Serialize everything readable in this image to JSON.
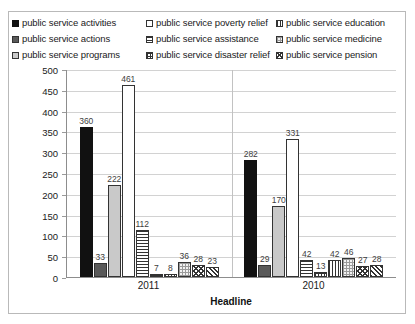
{
  "chart_data": {
    "type": "bar",
    "title": "",
    "xlabel": "Headline",
    "ylabel": "",
    "ylim": [
      0,
      500
    ],
    "ytick_step": 50,
    "yticks": [
      "500",
      "450",
      "400",
      "350",
      "300",
      "250",
      "200",
      "150",
      "100",
      "50",
      "0"
    ],
    "grid": true,
    "legend_position": "top",
    "categories": [
      "2011",
      "2010"
    ],
    "series": [
      {
        "name": "public service activities",
        "pattern": "solid-black",
        "values": [
          360,
          282
        ]
      },
      {
        "name": "public service actions",
        "pattern": "solid-dark",
        "values": [
          33,
          29
        ]
      },
      {
        "name": "public service programs",
        "pattern": "solid-light",
        "values": [
          222,
          170
        ]
      },
      {
        "name": "public service poverty relief",
        "pattern": "white",
        "values": [
          461,
          331
        ]
      },
      {
        "name": "public service assistance",
        "pattern": "hlines",
        "values": [
          112,
          42
        ]
      },
      {
        "name": "public service disaster relief",
        "pattern": "grid",
        "values": [
          7,
          13
        ]
      },
      {
        "name": "public service education",
        "pattern": "vlines",
        "values": [
          8,
          42
        ]
      },
      {
        "name": "public service medicine",
        "pattern": "dots",
        "values": [
          36,
          46
        ]
      },
      {
        "name": "public service pension",
        "pattern": "crossdiag",
        "values": [
          28,
          27
        ]
      },
      {
        "name": "public service extra",
        "pattern": "diag",
        "values": [
          23,
          28
        ]
      }
    ]
  },
  "legend": {
    "items": [
      {
        "label": "public service activities",
        "pattern": "solid-black"
      },
      {
        "label": "public service actions",
        "pattern": "solid-dark"
      },
      {
        "label": "public service programs",
        "pattern": "solid-light"
      },
      {
        "label": "public service poverty relief",
        "pattern": "white"
      },
      {
        "label": "public service assistance",
        "pattern": "hlines"
      },
      {
        "label": "public service disaster relief",
        "pattern": "grid"
      },
      {
        "label": "public service education",
        "pattern": "vlines"
      },
      {
        "label": "public service medicine",
        "pattern": "dots"
      },
      {
        "label": "public service pension",
        "pattern": "crossdiag"
      }
    ]
  },
  "colors": {
    "series_black": "#111111",
    "series_dark_gray": "#595959",
    "series_light_gray": "#c9c9c9",
    "series_white": "#ffffff",
    "gridline": "#d2d2d2",
    "axis": "#8d8d8d",
    "border": "#b9b9b9"
  }
}
